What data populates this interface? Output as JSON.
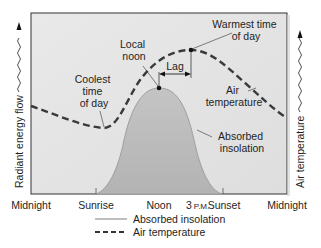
{
  "diagram": {
    "type": "daily-radiation-temperature-cycle",
    "colors": {
      "background": "#e6e6e6",
      "frame": "#333333",
      "insolation_fill": "#b9b9b9",
      "insolation_edge": "#9e9e9e",
      "dash_line": "#3a3a3a",
      "text": "#1e1e1e"
    },
    "y_axis_left": {
      "label": "Radiant energy flow",
      "icon": "wavy-arrow-up-icon"
    },
    "y_axis_right": {
      "label": "Air temperature",
      "icon": "wavy-arrow-up-icon"
    },
    "x_axis": {
      "ticks": [
        {
          "label": "Midnight"
        },
        {
          "label": "Sunrise"
        },
        {
          "label": "Noon"
        },
        {
          "label_num": "3",
          "label_unit": "P.M."
        },
        {
          "label": "Sunset"
        },
        {
          "label": "Midnight"
        }
      ]
    },
    "annotations": {
      "local_noon": [
        "Local",
        "noon"
      ],
      "warmest": [
        "Warmest time",
        "of day"
      ],
      "coolest": [
        "Coolest",
        "time",
        "of day"
      ],
      "lag": "Lag",
      "air_temperature": [
        "Air",
        "temperature"
      ],
      "absorbed_insolation": [
        "Absorbed",
        "insolation"
      ]
    },
    "legend": [
      {
        "style": "solid",
        "label": "Absorbed insolation"
      },
      {
        "style": "dashed",
        "label": "Air temperature"
      }
    ]
  }
}
